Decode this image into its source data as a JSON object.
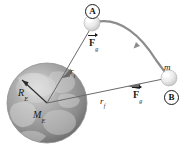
{
  "figure": {
    "background_color": "#ffffff",
    "line_color": "#555555",
    "text_color": "#1a1a1a",
    "earth_color": "#9a9a9a",
    "sphere_color": "#e8e8e8"
  },
  "labels": {
    "point_a": "A",
    "point_b": "B",
    "mass": "m",
    "earth_radius": "R",
    "earth_radius_sub": "E",
    "earth_mass": "M",
    "earth_mass_sub": "E",
    "r_initial": "r",
    "r_initial_sub": "i",
    "r_final": "r",
    "r_final_sub": "f",
    "force_symbol": "F",
    "force_sub": "g",
    "force_top_label": "F",
    "force_top_sub": "g",
    "force_bottom_label": "F",
    "force_bottom_sub": "g"
  },
  "elements": {
    "earth_name": "earth-globe",
    "sphere_a_name": "mass-sphere-a",
    "sphere_b_name": "mass-sphere-b",
    "trajectory_name": "trajectory-arc",
    "ri_vector_name": "r-initial-force-vector",
    "rf_vector_name": "r-final-force-vector",
    "radius_arrow_name": "earth-radius-arrow"
  }
}
